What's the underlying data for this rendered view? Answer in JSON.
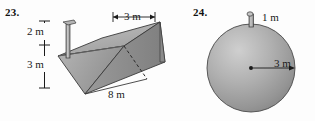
{
  "page": {
    "background_color": "#fdfdfd",
    "text_color": "#1a1a1a"
  },
  "figures": [
    {
      "number_label": "23.",
      "shape": "trapezoidal-prism-trough",
      "description": "Inverted trapezoidal prism (water trough) drawn in oblique view with a vertical spout pipe rising from the top face; hidden back edge shown dashed.",
      "fill_color": "#a9a9a9",
      "stroke_color": "#3a3a3a",
      "dimensions": [
        {
          "name": "spout-height",
          "value": "2 m",
          "orientation": "vertical"
        },
        {
          "name": "trough-depth",
          "value": "3 m",
          "orientation": "vertical"
        },
        {
          "name": "top-width",
          "value": "3 m",
          "orientation": "horizontal"
        },
        {
          "name": "length",
          "value": "8 m",
          "orientation": "horizontal"
        }
      ]
    },
    {
      "number_label": "24.",
      "shape": "sphere",
      "description": "Shaded sphere with a short vertical spout pipe on top and a radius arrow from center to right edge.",
      "fill_color": "#a8a8a8",
      "stroke_color": "#3a3a3a",
      "dimensions": [
        {
          "name": "spout-height",
          "value": "1 m",
          "orientation": "vertical"
        },
        {
          "name": "radius",
          "value": "3 m",
          "orientation": "horizontal"
        }
      ]
    }
  ],
  "labels": {
    "fig23_number": "23.",
    "fig24_number": "24.",
    "fig23_spout_height": "2 m",
    "fig23_depth": "3 m",
    "fig23_top_width": "3 m",
    "fig23_length": "8 m",
    "fig24_spout_height": "1 m",
    "fig24_radius": "3 m"
  }
}
